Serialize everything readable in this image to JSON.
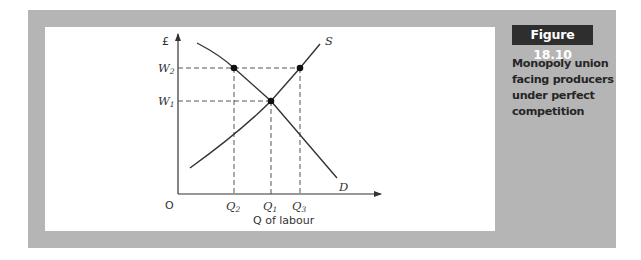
{
  "figure": {
    "badge": "Figure 18.10",
    "caption": "Monopoly union facing producers under perfect competition"
  },
  "colors": {
    "frame": "#b5b5b5",
    "badge_bg": "#2e2e2e",
    "line": "#333333"
  },
  "diagram": {
    "y_axis_label": "£",
    "x_axis_label": "Q of labour",
    "origin_label": "O",
    "y_ticks": [
      {
        "main": "W",
        "sub": "2"
      },
      {
        "main": "W",
        "sub": "1"
      }
    ],
    "x_ticks": [
      {
        "main": "Q",
        "sub": "2"
      },
      {
        "main": "Q",
        "sub": "1"
      },
      {
        "main": "Q",
        "sub": "3"
      }
    ],
    "curves": [
      {
        "name": "S",
        "description": "Supply of labour, upward sloping"
      },
      {
        "name": "D",
        "description": "Demand for labour, downward sloping"
      }
    ],
    "points": [
      {
        "label": "Q2,W2",
        "on": "D"
      },
      {
        "label": "Q1,W1",
        "on": "S and D intersection"
      },
      {
        "label": "Q3,W2",
        "on": "S"
      }
    ]
  }
}
